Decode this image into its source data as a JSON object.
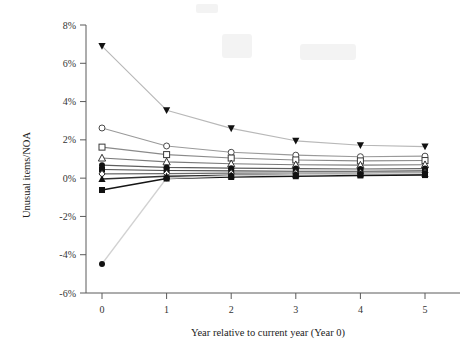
{
  "chart_data": {
    "type": "line",
    "title": "",
    "xlabel": "Year relative to current year (Year 0)",
    "ylabel": "Unusual items/NOA",
    "x": [
      0,
      1,
      2,
      3,
      4,
      5
    ],
    "xtick_labels": [
      "0",
      "1",
      "2",
      "3",
      "4",
      "5"
    ],
    "ytick_labels": [
      "-6%",
      "-4%",
      "-2%",
      "0%",
      "2%",
      "4%",
      "6%",
      "8%"
    ],
    "ytick_values": [
      -6,
      -4,
      -2,
      0,
      2,
      4,
      6,
      8
    ],
    "xlim": [
      -0.35,
      5.35
    ],
    "ylim": [
      -6,
      8
    ],
    "grid": false,
    "legend": "none",
    "y_unit": "percent",
    "series": [
      {
        "name": "Portfolio 10 (most positive unusual items)",
        "marker": "triangle-down-filled",
        "color": "#b8b8b8",
        "marker_color": "#111111",
        "values": [
          6.9,
          3.55,
          2.6,
          1.95,
          1.72,
          1.65
        ]
      },
      {
        "name": "Portfolio 9",
        "marker": "circle-open",
        "color": "#9a9a9a",
        "marker_color": "#4a4a4a",
        "values": [
          2.62,
          1.68,
          1.35,
          1.2,
          1.12,
          1.15
        ]
      },
      {
        "name": "Portfolio 8",
        "marker": "square-open",
        "color": "#8a8a8a",
        "marker_color": "#3a3a3a",
        "values": [
          1.62,
          1.23,
          1.05,
          0.95,
          0.9,
          0.92
        ]
      },
      {
        "name": "Portfolio 7",
        "marker": "triangle-up-open",
        "color": "#7a7a7a",
        "marker_color": "#333333",
        "values": [
          1.05,
          0.85,
          0.75,
          0.7,
          0.68,
          0.7
        ]
      },
      {
        "name": "Portfolio 6",
        "marker": "circle-filled",
        "color": "#5e5e5e",
        "marker_color": "#111111",
        "values": [
          0.68,
          0.56,
          0.52,
          0.5,
          0.48,
          0.5
        ]
      },
      {
        "name": "Portfolio 5",
        "marker": "square-filled",
        "color": "#4a4a4a",
        "marker_color": "#111111",
        "values": [
          0.45,
          0.4,
          0.38,
          0.36,
          0.36,
          0.38
        ]
      },
      {
        "name": "Portfolio 4",
        "marker": "diamond-open",
        "color": "#6a6a6a",
        "marker_color": "#2a2a2a",
        "values": [
          0.22,
          0.24,
          0.26,
          0.27,
          0.27,
          0.28
        ]
      },
      {
        "name": "Portfolio 3",
        "marker": "triangle-up-filled",
        "color": "#303030",
        "marker_color": "#111111",
        "values": [
          -0.05,
          0.1,
          0.15,
          0.18,
          0.2,
          0.22
        ]
      },
      {
        "name": "Portfolio 2",
        "marker": "square-filled",
        "color": "#151515",
        "marker_color": "#111111",
        "values": [
          -0.62,
          -0.02,
          0.06,
          0.1,
          0.14,
          0.16
        ]
      },
      {
        "name": "Portfolio 1 (most negative unusual items)",
        "marker": "circle-filled",
        "color": "#d2d2d2",
        "marker_color": "#111111",
        "values": [
          -4.48,
          0.0,
          0.12,
          0.18,
          0.22,
          0.26
        ]
      }
    ]
  },
  "axes": {
    "y_title": "Unusual items/NOA",
    "x_title": "Year relative to current year (Year 0)"
  }
}
